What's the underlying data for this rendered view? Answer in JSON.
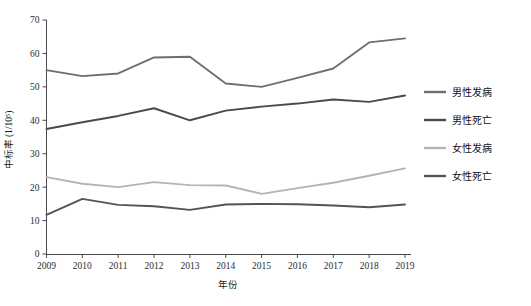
{
  "chart_data": {
    "type": "line",
    "title": "",
    "xlabel": "年份",
    "ylabel": "中标率 (1/10⁵)",
    "categories": [
      "2009",
      "2010",
      "2011",
      "2012",
      "2013",
      "2014",
      "2015",
      "2016",
      "2017",
      "2018",
      "2019"
    ],
    "x": [
      2009,
      2010,
      2011,
      2012,
      2013,
      2014,
      2015,
      2016,
      2017,
      2018,
      2019
    ],
    "xlim": [
      2009,
      2019
    ],
    "ylim": [
      0,
      70
    ],
    "y_ticks": [
      0,
      10,
      20,
      30,
      40,
      50,
      60,
      70
    ],
    "grid": false,
    "legend_position": "right",
    "series": [
      {
        "name": "男性发病",
        "color": "#6f6f6f",
        "values": [
          55.0,
          53.2,
          54.0,
          58.8,
          59.0,
          51.0,
          50.0,
          52.7,
          55.5,
          63.3,
          64.5
        ]
      },
      {
        "name": "男性死亡",
        "color": "#4a4a4a",
        "values": [
          37.4,
          39.4,
          41.3,
          43.6,
          40.0,
          42.9,
          44.1,
          45.0,
          46.2,
          45.5,
          47.4
        ]
      },
      {
        "name": "女性发病",
        "color": "#b4b4b4",
        "values": [
          23.0,
          21.0,
          20.0,
          21.5,
          20.6,
          20.5,
          18.0,
          19.7,
          21.3,
          23.4,
          25.6
        ]
      },
      {
        "name": "女性死亡",
        "color": "#545454",
        "values": [
          11.7,
          16.5,
          14.7,
          14.3,
          13.2,
          14.8,
          15.0,
          14.9,
          14.5,
          14.0,
          14.8
        ]
      }
    ]
  },
  "axes": {
    "y_tick_labels": [
      "0",
      "10",
      "20",
      "30",
      "40",
      "50",
      "60",
      "70"
    ],
    "x_tick_labels": [
      "2009",
      "2010",
      "2011",
      "2012",
      "2013",
      "2014",
      "2015",
      "2016",
      "2017",
      "2018",
      "2019"
    ],
    "y_axis_title": "中标率 (1/10⁵)",
    "x_axis_title": "年份"
  },
  "legend": {
    "items": [
      {
        "label": "男性发病",
        "color": "#6f6f6f"
      },
      {
        "label": "男性死亡",
        "color": "#4a4a4a"
      },
      {
        "label": "女性发病",
        "color": "#b4b4b4"
      },
      {
        "label": "女性死亡",
        "color": "#545454"
      }
    ]
  }
}
